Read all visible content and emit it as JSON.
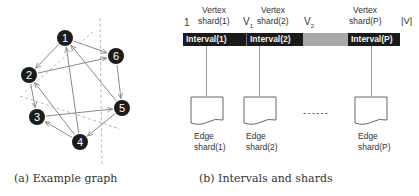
{
  "panel_a": {
    "caption": "(a) Example graph",
    "nodes": [
      {
        "id": "1",
        "x": 65,
        "y": 38
      },
      {
        "id": "2",
        "x": 29,
        "y": 75
      },
      {
        "id": "3",
        "x": 37,
        "y": 117
      },
      {
        "id": "4",
        "x": 80,
        "y": 142
      },
      {
        "id": "5",
        "x": 122,
        "y": 108
      },
      {
        "id": "6",
        "x": 116,
        "y": 56
      }
    ],
    "edges": [
      {
        "from": "1",
        "to": "2"
      },
      {
        "from": "1",
        "to": "6"
      },
      {
        "from": "2",
        "to": "6"
      },
      {
        "from": "2",
        "to": "3"
      },
      {
        "from": "6",
        "to": "5"
      },
      {
        "from": "4",
        "to": "1"
      },
      {
        "from": "4",
        "to": "2"
      },
      {
        "from": "4",
        "to": "3"
      },
      {
        "from": "3",
        "to": "5"
      },
      {
        "from": "5",
        "to": "1"
      },
      {
        "from": "5",
        "to": "4"
      }
    ]
  },
  "panel_b": {
    "caption": "(b) Intervals and shards",
    "boundary_labels": {
      "start": "1",
      "v1": "V",
      "v1_sub": "1",
      "v2": "V",
      "v2_sub": "2",
      "end": "|V|"
    },
    "vertex_shards": [
      {
        "line1": "Vertex",
        "line2": "shard(1)"
      },
      {
        "line1": "Vertex",
        "line2": "shard(2)"
      },
      {
        "line1": "Vertex",
        "line2": "shard(P)"
      }
    ],
    "intervals": [
      {
        "label": "Interval(1)"
      },
      {
        "label": "Interval(2)"
      },
      {
        "label": "Interval(P)"
      }
    ],
    "edge_shards": [
      {
        "line1": "Edge",
        "line2": "shard(1)"
      },
      {
        "line1": "Edge",
        "line2": "shard(2)"
      },
      {
        "line1": "Edge",
        "line2": "shard(P)"
      }
    ],
    "ellipsis": "------"
  }
}
